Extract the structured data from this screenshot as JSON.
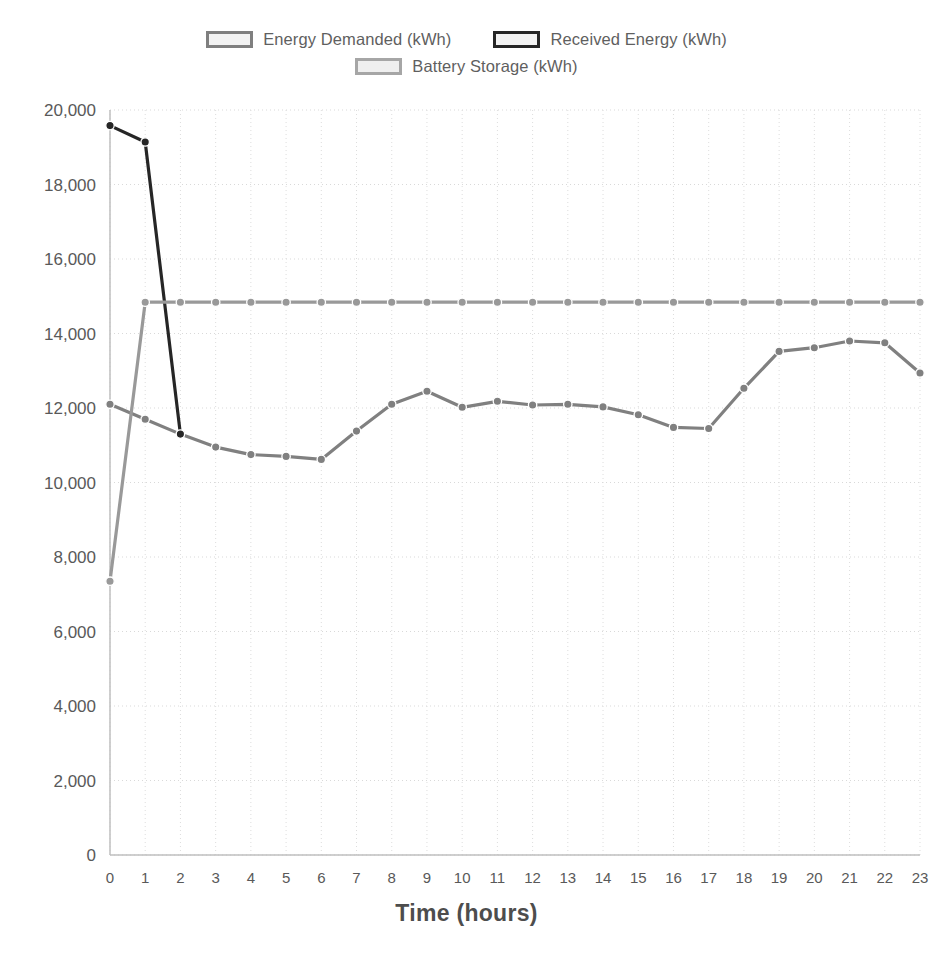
{
  "legend": {
    "rows": [
      [
        {
          "label": "Energy Demanded (kWh)",
          "swatch_border": "#7f7f7f",
          "swatch_fill": "#f2f2f2",
          "icon": "legend-swatch-icon"
        },
        {
          "label": "Received Energy (kWh)",
          "swatch_border": "#262626",
          "swatch_fill": "#f2f2f2",
          "icon": "legend-swatch-icon"
        }
      ],
      [
        {
          "label": "Battery Storage (kWh)",
          "swatch_border": "#a6a6a6",
          "swatch_fill": "#efefef",
          "icon": "legend-swatch-icon"
        }
      ]
    ]
  },
  "axis": {
    "x_title": "Time (hours)"
  },
  "chart_data": {
    "type": "line",
    "title": "",
    "xlabel": "Time (hours)",
    "ylabel": "",
    "xlim": [
      0,
      23
    ],
    "ylim": [
      0,
      20000
    ],
    "ytick_step": 2000,
    "grid": true,
    "legend_position": "top",
    "x": [
      0,
      1,
      2,
      3,
      4,
      5,
      6,
      7,
      8,
      9,
      10,
      11,
      12,
      13,
      14,
      15,
      16,
      17,
      18,
      19,
      20,
      21,
      22,
      23
    ],
    "xtick_labels": [
      "0",
      "1",
      "2",
      "3",
      "4",
      "5",
      "6",
      "7",
      "8",
      "9",
      "10",
      "11",
      "12",
      "13",
      "14",
      "15",
      "16",
      "17",
      "18",
      "19",
      "20",
      "21",
      "22",
      "23"
    ],
    "ytick_labels": [
      "0",
      "2,000",
      "4,000",
      "6,000",
      "8,000",
      "10,000",
      "12,000",
      "14,000",
      "16,000",
      "18,000",
      "20,000"
    ],
    "ytick_values": [
      0,
      2000,
      4000,
      6000,
      8000,
      10000,
      12000,
      14000,
      16000,
      18000,
      20000
    ],
    "series": [
      {
        "name": "Energy Demanded (kWh)",
        "color": "#808080",
        "marker": "circle",
        "values": [
          12100,
          11700,
          11300,
          10950,
          10750,
          10700,
          10620,
          11380,
          12100,
          12450,
          12020,
          12180,
          12080,
          12100,
          12030,
          11820,
          11480,
          11450,
          12530,
          13520,
          13620,
          13800,
          13750,
          12940
        ]
      },
      {
        "name": "Received Energy (kWh)",
        "color": "#262626",
        "marker": "circle",
        "values": [
          19580,
          19140,
          11300,
          null,
          null,
          null,
          null,
          null,
          null,
          null,
          null,
          null,
          null,
          null,
          null,
          null,
          null,
          null,
          null,
          null,
          null,
          null,
          null,
          null
        ]
      },
      {
        "name": "Battery Storage (kWh)",
        "color": "#999999",
        "marker": "circle",
        "values": [
          7350,
          14840,
          14840,
          14840,
          14840,
          14840,
          14840,
          14840,
          14840,
          14840,
          14840,
          14840,
          14840,
          14840,
          14840,
          14840,
          14840,
          14840,
          14840,
          14840,
          14840,
          14840,
          14840,
          14840
        ]
      }
    ]
  }
}
